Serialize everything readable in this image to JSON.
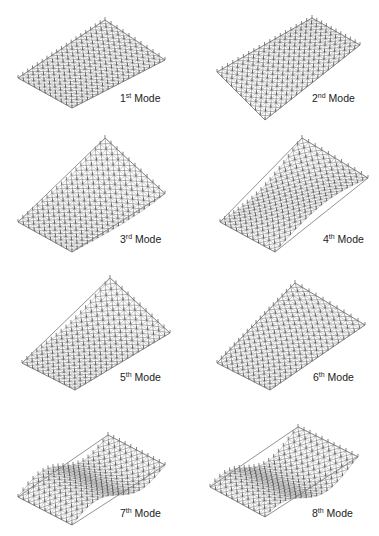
{
  "figure": {
    "panels": [
      {
        "id": 1,
        "num": "1",
        "suffix": "st",
        "word": "Mode",
        "shape": "flat-tilt",
        "x": 0,
        "y": 0
      },
      {
        "id": 2,
        "num": "2",
        "suffix": "nd",
        "word": "Mode",
        "shape": "twist",
        "x": 190,
        "y": 0
      },
      {
        "id": 3,
        "num": "3",
        "suffix": "rd",
        "word": "Mode",
        "shape": "bend-up-corner",
        "x": 0,
        "y": 130
      },
      {
        "id": 4,
        "num": "4",
        "suffix": "th",
        "word": "Mode",
        "shape": "saddle",
        "x": 190,
        "y": 130
      },
      {
        "id": 5,
        "num": "5",
        "suffix": "th",
        "word": "Mode",
        "shape": "fold",
        "x": 0,
        "y": 265
      },
      {
        "id": 6,
        "num": "6",
        "suffix": "th",
        "word": "Mode",
        "shape": "flat",
        "x": 190,
        "y": 265
      },
      {
        "id": 7,
        "num": "7",
        "suffix": "th",
        "word": "Mode",
        "shape": "s-wave",
        "x": 0,
        "y": 400
      },
      {
        "id": 8,
        "num": "8",
        "suffix": "th",
        "word": "Mode",
        "shape": "s-wave-2",
        "x": 190,
        "y": 400
      }
    ],
    "colors": {
      "mesh": "#555555",
      "mesh_light": "#9a9a9a",
      "text": "#222222",
      "background": "#ffffff"
    }
  }
}
